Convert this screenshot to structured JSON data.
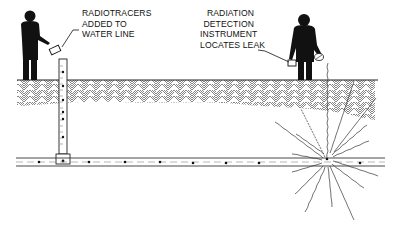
{
  "diagram": {
    "type": "radiotracer leak detection illustration",
    "labels": {
      "left": {
        "lines": [
          "RADIOTRACERS",
          "ADDED TO",
          "WATER LINE"
        ]
      },
      "right": {
        "lines": [
          "RADIATION",
          "DETECTION",
          "INSTRUMENT",
          "LOCATES LEAK"
        ]
      }
    },
    "elements": {
      "ground": "cross-hatched soil layer",
      "pipe": "horizontal water line with tracer particles",
      "riser": "vertical injection pipe",
      "leak": "radiation burst at leak point"
    },
    "colors": {
      "ink": "#111111",
      "background": "#ffffff"
    }
  }
}
